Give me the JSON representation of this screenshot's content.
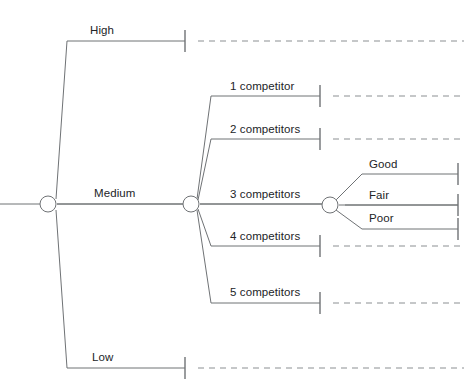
{
  "diagram": {
    "type": "decision-tree",
    "title": "",
    "background_color": "#ffffff",
    "line_color": "#6f7275",
    "text_color": "#222427",
    "nodes": [
      {
        "id": "root",
        "kind": "chance-node",
        "x": 48,
        "y": 204,
        "r": 8
      },
      {
        "id": "medium-node",
        "kind": "chance-node",
        "x": 191,
        "y": 204,
        "r": 8
      },
      {
        "id": "three-comp-node",
        "kind": "chance-node",
        "x": 330,
        "y": 205,
        "r": 8
      }
    ],
    "levels": [
      {
        "name": "demand-level",
        "branches": [
          {
            "id": "high",
            "label": "High",
            "label_x": 90,
            "label_y": 24,
            "line_y": 41,
            "start_x": 67,
            "end_x": 185,
            "tick": true,
            "dash_to": 464
          },
          {
            "id": "medium",
            "label": "Medium",
            "label_x": 94,
            "label_y": 187,
            "line_y": 204,
            "start_x": 57,
            "end_x": 183,
            "tick": false,
            "dash_to": 0
          },
          {
            "id": "low",
            "label": "Low",
            "label_x": 92,
            "label_y": 351,
            "line_y": 368,
            "start_x": 67,
            "end_x": 185,
            "tick": true,
            "dash_to": 464
          }
        ]
      },
      {
        "name": "competitor-count",
        "branches": [
          {
            "id": "c1",
            "label": "1 competitor",
            "label_x": 230,
            "label_y": 80,
            "line_y": 96,
            "start_x": 211,
            "end_x": 320,
            "tick": true,
            "dash_to": 464
          },
          {
            "id": "c2",
            "label": "2 competitors",
            "label_x": 230,
            "label_y": 123,
            "line_y": 139,
            "start_x": 211,
            "end_x": 320,
            "tick": true,
            "dash_to": 464
          },
          {
            "id": "c3",
            "label": "3 competitors",
            "label_x": 230,
            "label_y": 188,
            "line_y": 204,
            "start_x": 200,
            "end_x": 322,
            "tick": false,
            "dash_to": 0
          },
          {
            "id": "c4",
            "label": "4 competitors",
            "label_x": 230,
            "label_y": 230,
            "line_y": 246,
            "start_x": 211,
            "end_x": 320,
            "tick": true,
            "dash_to": 464
          },
          {
            "id": "c5",
            "label": "5 competitors",
            "label_x": 230,
            "label_y": 286,
            "line_y": 303,
            "start_x": 211,
            "end_x": 320,
            "tick": true,
            "dash_to": 464
          }
        ]
      },
      {
        "name": "outcome-quality",
        "branches": [
          {
            "id": "good",
            "label": "Good",
            "label_x": 369,
            "label_y": 158,
            "line_y": 174,
            "start_x": 362,
            "end_x": 458,
            "tick": true,
            "dash_to": 0
          },
          {
            "id": "fair",
            "label": "Fair",
            "label_x": 369,
            "label_y": 189,
            "line_y": 205,
            "start_x": 345,
            "end_x": 458,
            "tick": true,
            "dash_to": 0
          },
          {
            "id": "poor",
            "label": "Poor",
            "label_x": 369,
            "label_y": 212,
            "line_y": 229,
            "start_x": 362,
            "end_x": 458,
            "tick": true,
            "dash_to": 0
          }
        ]
      }
    ],
    "connectors": [
      {
        "from": "root",
        "to": "high",
        "points": "56,199 67,41"
      },
      {
        "from": "root",
        "to": "medium",
        "points": "57,204 183,204"
      },
      {
        "from": "root",
        "to": "low",
        "points": "56,210 67,368"
      },
      {
        "from": "medium-node",
        "to": "c1",
        "points": "197,199 211,96"
      },
      {
        "from": "medium-node",
        "to": "c2",
        "points": "198,200 211,139"
      },
      {
        "from": "medium-node",
        "to": "c3",
        "points": "200,204 322,204"
      },
      {
        "from": "medium-node",
        "to": "c4",
        "points": "198,209 211,246"
      },
      {
        "from": "medium-node",
        "to": "c5",
        "points": "197,210 211,303"
      },
      {
        "from": "three-comp-node",
        "to": "good",
        "points": "336,200 362,174"
      },
      {
        "from": "three-comp-node",
        "to": "fair",
        "points": "339,205 458,205"
      },
      {
        "from": "three-comp-node",
        "to": "poor",
        "points": "336,210 362,229"
      }
    ],
    "stub_lines": [
      {
        "id": "root-stub-left",
        "x1": 0,
        "y1": 204,
        "x2": 40,
        "y2": 204
      }
    ]
  }
}
